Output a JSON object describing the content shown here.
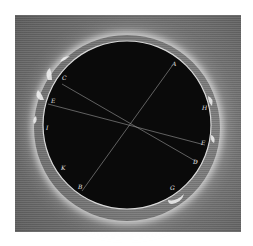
{
  "figure": {
    "disc_color": "#0a0a0a",
    "background_color": "#7a7a7a",
    "corona_color": "#f0f0f0",
    "labels": [
      {
        "id": "A",
        "x": 172,
        "y": 66
      },
      {
        "id": "B",
        "x": 80,
        "y": 189
      },
      {
        "id": "C",
        "x": 63,
        "y": 78
      },
      {
        "id": "D",
        "x": 195,
        "y": 162
      },
      {
        "id": "E",
        "x": 52,
        "y": 101
      },
      {
        "id": "F",
        "x": 203,
        "y": 142
      },
      {
        "id": "G",
        "x": 172,
        "y": 188
      },
      {
        "id": "H",
        "x": 204,
        "y": 107
      },
      {
        "id": "I",
        "x": 46,
        "y": 128
      },
      {
        "id": "K",
        "x": 62,
        "y": 168
      }
    ],
    "lines": [
      {
        "from": "A",
        "to": "B"
      },
      {
        "from": "C",
        "to": "D"
      },
      {
        "from": "E",
        "to": "F"
      }
    ]
  }
}
